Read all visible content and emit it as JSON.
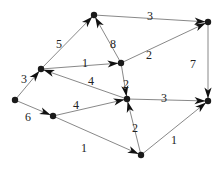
{
  "diagram": {
    "type": "weighted-directed-graph",
    "colors": {
      "edge": "#7a7a7a",
      "node": "#1a1a1a",
      "arrow": "#111111",
      "label": "#222222"
    },
    "nodes": [
      {
        "id": "A",
        "x": 15,
        "y": 100
      },
      {
        "id": "B",
        "x": 41,
        "y": 69
      },
      {
        "id": "C",
        "x": 53,
        "y": 116
      },
      {
        "id": "T",
        "x": 94,
        "y": 15
      },
      {
        "id": "D",
        "x": 121,
        "y": 63
      },
      {
        "id": "E",
        "x": 127,
        "y": 99
      },
      {
        "id": "F",
        "x": 141,
        "y": 155
      },
      {
        "id": "H",
        "x": 208,
        "y": 22
      },
      {
        "id": "G",
        "x": 208,
        "y": 101
      }
    ],
    "edges": [
      {
        "from": "A",
        "to": "B",
        "weight": "3",
        "lx": 24,
        "ly": 80
      },
      {
        "from": "A",
        "to": "C",
        "weight": "6",
        "lx": 28,
        "ly": 118
      },
      {
        "from": "B",
        "to": "T",
        "weight": "5",
        "lx": 59,
        "ly": 45
      },
      {
        "from": "B",
        "to": "D",
        "weight": "1",
        "lx": 85,
        "ly": 64
      },
      {
        "from": "E",
        "to": "B",
        "weight": "4",
        "lx": 91,
        "ly": 82
      },
      {
        "from": "C",
        "to": "E",
        "weight": "4",
        "lx": 76,
        "ly": 106
      },
      {
        "from": "C",
        "to": "F",
        "weight": "1",
        "lx": 84,
        "ly": 149
      },
      {
        "from": "D",
        "to": "T",
        "weight": "8",
        "lx": 113,
        "ly": 45
      },
      {
        "from": "T",
        "to": "H",
        "weight": "3",
        "lx": 150,
        "ly": 17
      },
      {
        "from": "D",
        "to": "H",
        "weight": "2",
        "lx": 149,
        "ly": 56
      },
      {
        "from": "D",
        "to": "E",
        "weight": "2",
        "lx": 126,
        "ly": 85
      },
      {
        "from": "H",
        "to": "G",
        "weight": "7",
        "lx": 193,
        "ly": 65
      },
      {
        "from": "E",
        "to": "G",
        "weight": "3",
        "lx": 164,
        "ly": 99
      },
      {
        "from": "F",
        "to": "E",
        "weight": "2",
        "lx": 135,
        "ly": 129
      },
      {
        "from": "F",
        "to": "G",
        "weight": "1",
        "lx": 174,
        "ly": 141
      }
    ]
  }
}
